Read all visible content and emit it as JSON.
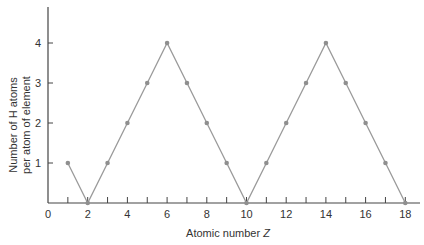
{
  "chart_data": {
    "type": "line",
    "title": "",
    "xlabel": "Atomic number Z",
    "xlabel_main": "Atomic number ",
    "xlabel_var": "Z",
    "ylabel_line1": "Number of H atoms",
    "ylabel_line2": "per atom of element",
    "xlim": [
      0,
      18
    ],
    "ylim": [
      0,
      4
    ],
    "grid": false,
    "x_ticks": [
      1,
      2,
      3,
      4,
      5,
      6,
      7,
      8,
      9,
      10,
      11,
      12,
      13,
      14,
      15,
      16,
      17,
      18
    ],
    "x_tick_labels": [
      "0",
      "2",
      "4",
      "6",
      "8",
      "10",
      "12",
      "14",
      "16",
      "18"
    ],
    "y_tick_labels": [
      "1",
      "2",
      "3",
      "4"
    ],
    "series": [
      {
        "name": "H atoms per atom",
        "x": [
          1,
          2,
          3,
          4,
          5,
          6,
          7,
          8,
          9,
          10,
          11,
          12,
          13,
          14,
          15,
          16,
          17,
          18
        ],
        "values": [
          1,
          0,
          1,
          2,
          3,
          4,
          3,
          2,
          1,
          0,
          1,
          2,
          3,
          4,
          3,
          2,
          1,
          0
        ]
      }
    ],
    "colors": {
      "line": "#9a9a9a",
      "marker": "#8f8f8f",
      "axis": "#444444"
    }
  }
}
